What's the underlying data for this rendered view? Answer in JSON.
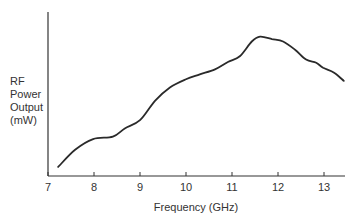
{
  "chart_data": {
    "type": "line",
    "title": "",
    "xlabel": "Frequency (GHz)",
    "ylabel": "RF Power Output (mW)",
    "ylabel_lines": [
      "RF",
      "Power",
      "Output",
      "(mW)"
    ],
    "xlim": [
      7,
      13.45
    ],
    "ylim": [
      0,
      100
    ],
    "xticks": [
      7,
      8,
      9,
      10,
      11,
      12,
      13
    ],
    "yticks": [],
    "grid": false,
    "legend": null,
    "series": [
      {
        "name": "RF Power Output",
        "color": "#2a2a2a",
        "x": [
          7.22,
          7.59,
          7.98,
          8.41,
          8.67,
          9.0,
          9.33,
          9.65,
          10.0,
          10.3,
          10.63,
          10.91,
          11.17,
          11.43,
          11.61,
          11.87,
          12.11,
          12.37,
          12.61,
          12.83,
          12.98,
          13.22,
          13.43
        ],
        "y": [
          5.5,
          16,
          22.5,
          24,
          29,
          34,
          46,
          54,
          59,
          62,
          65,
          69.5,
          73,
          82,
          85,
          83.5,
          82,
          77,
          71,
          69,
          66,
          63,
          58
        ]
      }
    ],
    "note": "Y axis has no numeric scale; values are relative (0-100 of axis height)."
  },
  "axis": {
    "x_label": "Frequency (GHz)",
    "y_label": {
      "line1": "RF",
      "line2": "Power",
      "line3": "Output",
      "line4": "(mW)"
    }
  }
}
